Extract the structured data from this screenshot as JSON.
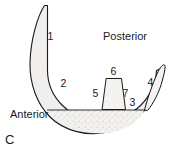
{
  "figure": {
    "panel_label": "C",
    "orientation_labels": [
      {
        "id": "anterior",
        "text": "Anterior"
      },
      {
        "id": "posterior",
        "text": "Posterior"
      }
    ],
    "numeric_labels": [
      {
        "id": "label-1",
        "text": "1"
      },
      {
        "id": "label-2",
        "text": "2"
      },
      {
        "id": "label-3",
        "text": "3"
      },
      {
        "id": "label-4",
        "text": "4"
      },
      {
        "id": "label-5",
        "text": "5"
      },
      {
        "id": "label-6",
        "text": "6"
      },
      {
        "id": "label-7",
        "text": "7"
      }
    ],
    "colors": {
      "background": "#ffffff",
      "stroke": "#1a1a1a",
      "fill_light": "#f0efed",
      "fill_stipple": "#eeedea"
    }
  }
}
